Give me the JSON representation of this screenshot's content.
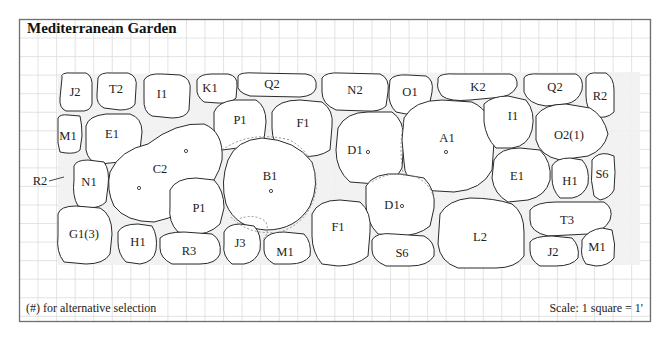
{
  "title": "Mediterranean Garden",
  "footer": {
    "legend_note": "(#) for alternative selection",
    "scale": "Scale: 1 square = 1'"
  },
  "colors": {
    "outline": "#2a2a2a",
    "grid": "#dcdcdc",
    "frame": "#6f6f6f",
    "gravel": "#f1f1f1"
  },
  "plants": [
    {
      "id": "J2-a",
      "label": "J2"
    },
    {
      "id": "T2",
      "label": "T2"
    },
    {
      "id": "I1-a",
      "label": "I1"
    },
    {
      "id": "K1",
      "label": "K1"
    },
    {
      "id": "Q2-a",
      "label": "Q2"
    },
    {
      "id": "N2",
      "label": "N2"
    },
    {
      "id": "O1",
      "label": "O1"
    },
    {
      "id": "K2",
      "label": "K2"
    },
    {
      "id": "Q2-b",
      "label": "Q2"
    },
    {
      "id": "R2-a",
      "label": "R2"
    },
    {
      "id": "M1-a",
      "label": "M1"
    },
    {
      "id": "E1-a",
      "label": "E1"
    },
    {
      "id": "P1-a",
      "label": "P1"
    },
    {
      "id": "F1-a",
      "label": "F1"
    },
    {
      "id": "D1-a",
      "label": "D1"
    },
    {
      "id": "A1",
      "label": "A1"
    },
    {
      "id": "I1-b",
      "label": "I1"
    },
    {
      "id": "O2",
      "label": "O2(1)"
    },
    {
      "id": "R2-b",
      "label": "R2"
    },
    {
      "id": "C2",
      "label": "C2"
    },
    {
      "id": "N1",
      "label": "N1"
    },
    {
      "id": "B1",
      "label": "B1"
    },
    {
      "id": "E1-b",
      "label": "E1"
    },
    {
      "id": "H1-a",
      "label": "H1"
    },
    {
      "id": "S6-a",
      "label": "S6"
    },
    {
      "id": "P1-b",
      "label": "P1"
    },
    {
      "id": "D1-b",
      "label": "D1"
    },
    {
      "id": "G1",
      "label": "G1(3)"
    },
    {
      "id": "F1-b",
      "label": "F1"
    },
    {
      "id": "T3",
      "label": "T3"
    },
    {
      "id": "H1-b",
      "label": "H1"
    },
    {
      "id": "L2",
      "label": "L2"
    },
    {
      "id": "R3",
      "label": "R3"
    },
    {
      "id": "J3",
      "label": "J3"
    },
    {
      "id": "M1-b",
      "label": "M1"
    },
    {
      "id": "S6-b",
      "label": "S6"
    },
    {
      "id": "J2-b",
      "label": "J2"
    },
    {
      "id": "M1-c",
      "label": "M1"
    }
  ]
}
